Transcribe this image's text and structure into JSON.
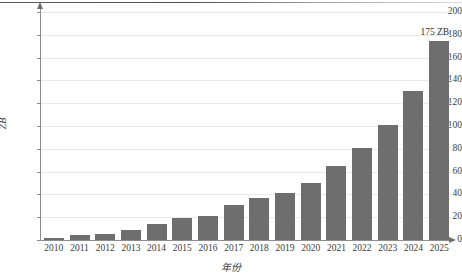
{
  "chart_data": {
    "type": "bar",
    "title": "",
    "subtitle": "",
    "xlabel": "年份",
    "ylabel": "ZB",
    "ylim": [
      0,
      200
    ],
    "yticks": [
      0,
      20,
      40,
      60,
      80,
      100,
      120,
      140,
      160,
      180,
      200
    ],
    "grid": true,
    "legend": false,
    "legend_position": "none",
    "bar_color": "#6e6e6e",
    "categories": [
      "2010",
      "2011",
      "2012",
      "2013",
      "2014",
      "2015",
      "2016",
      "2017",
      "2018",
      "2019",
      "2020",
      "2021",
      "2022",
      "2023",
      "2024",
      "2025"
    ],
    "values": [
      2,
      4,
      5,
      9,
      14,
      19,
      21,
      31,
      37,
      41,
      50,
      65,
      81,
      101,
      131,
      175
    ],
    "annotations": [
      {
        "text": "175 ZB",
        "category": "2025",
        "value": 175
      }
    ]
  }
}
